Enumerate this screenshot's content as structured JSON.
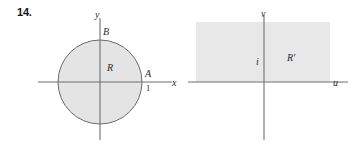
{
  "exercise": {
    "number": "14."
  },
  "figures": [
    {
      "name": "xy-plane",
      "axes": {
        "x_axis_label": "x",
        "y_axis_label": "y",
        "x_axis": {
          "x1": 38,
          "y1": 82,
          "x2": 172,
          "y2": 82
        },
        "y_axis": {
          "x1": 100,
          "y1": 18,
          "x2": 100,
          "y2": 140
        }
      },
      "region": {
        "type": "circle",
        "label": "R",
        "cx": 100,
        "cy": 82,
        "r": 42,
        "fill": "#e4e4e4",
        "stroke": "#6b6b6b"
      },
      "points": [
        {
          "label": "B",
          "x": 100,
          "y": 40
        },
        {
          "label": "A",
          "x": 142,
          "y": 82
        }
      ],
      "ticks": [
        {
          "label": "1",
          "axis": "x",
          "value": 1
        }
      ]
    },
    {
      "name": "uv-plane",
      "axes": {
        "x_axis_label": "u",
        "y_axis_label": "v",
        "u_axis": {
          "x1": 188,
          "y1": 82,
          "x2": 348,
          "y2": 82
        },
        "v_axis": {
          "x1": 264,
          "y1": 15,
          "x2": 264,
          "y2": 140
        }
      },
      "region": {
        "type": "rect",
        "label": "R'",
        "x": 196,
        "y": 22,
        "width": 134,
        "height": 60,
        "fill": "#e8e8e8",
        "stroke": "none"
      },
      "points": [
        {
          "label": "i",
          "x": 258,
          "y": 62
        }
      ]
    }
  ],
  "colors": {
    "ink": "#2b2b2b",
    "axis": "#6f6f6f",
    "circle_fill": "#e4e4e4",
    "circle_stroke": "#6b6b6b",
    "rect_fill": "#e8e8e8",
    "page_bg": "#ffffff"
  }
}
